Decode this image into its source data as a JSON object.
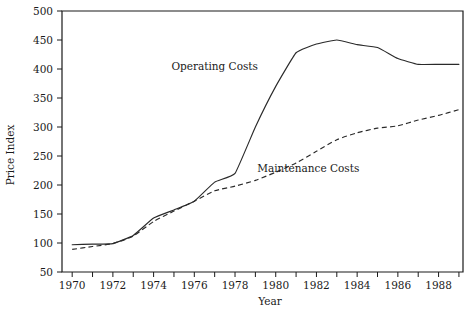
{
  "chart_data": {
    "type": "line",
    "title": "",
    "xlabel": "Year",
    "ylabel": "Price Index",
    "xlim": [
      1969.5,
      1989.2
    ],
    "ylim": [
      50,
      500
    ],
    "grid": false,
    "legend": "inline-annotations",
    "x": [
      1970,
      1971,
      1972,
      1973,
      1974,
      1975,
      1976,
      1977,
      1978,
      1979,
      1980,
      1981,
      1982,
      1983,
      1984,
      1985,
      1986,
      1987,
      1988,
      1989
    ],
    "xticks_labeled": [
      1970,
      1972,
      1974,
      1976,
      1978,
      1980,
      1982,
      1984,
      1986,
      1988
    ],
    "yticks": [
      50,
      100,
      150,
      200,
      250,
      300,
      350,
      400,
      450,
      500
    ],
    "series": [
      {
        "name": "Operating Costs",
        "style": "solid",
        "label_x": 1977.0,
        "label_y": 398,
        "values": [
          97,
          98,
          99,
          113,
          143,
          157,
          172,
          205,
          220,
          300,
          370,
          428,
          443,
          450,
          442,
          437,
          418,
          408,
          408,
          408
        ]
      },
      {
        "name": "Maintenance Costs",
        "style": "dashed",
        "label_x": 1981.6,
        "label_y": 222,
        "values": [
          89,
          94,
          99,
          112,
          137,
          155,
          172,
          190,
          198,
          208,
          222,
          238,
          258,
          278,
          290,
          298,
          302,
          312,
          320,
          330
        ]
      }
    ]
  },
  "axis": {
    "y_tick_labels": [
      "500",
      "450",
      "400",
      "350",
      "300",
      "250",
      "200",
      "150",
      "100",
      "50"
    ],
    "x_tick_labels": [
      "1970",
      "1972",
      "1974",
      "1976",
      "1978",
      "1980",
      "1982",
      "1984",
      "1986",
      "1988"
    ],
    "y_title": "Price Index",
    "x_title": "Year"
  },
  "colors": {
    "line": "#2a2a2a",
    "axis": "#1a1a1a",
    "background": "#ffffff"
  }
}
